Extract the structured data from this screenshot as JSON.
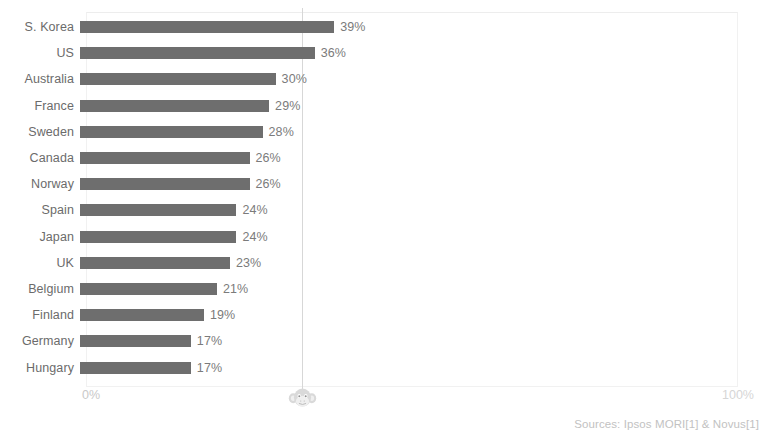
{
  "chart_data": {
    "type": "bar",
    "orientation": "horizontal",
    "title": "",
    "xlabel": "",
    "ylabel": "",
    "xlim": [
      0,
      100
    ],
    "grid": false,
    "legend": null,
    "axis_ticks": [
      "0%",
      "100%"
    ],
    "reference_line_value": 33,
    "categories": [
      "S. Korea",
      "US",
      "Australia",
      "France",
      "Sweden",
      "Canada",
      "Norway",
      "Spain",
      "Japan",
      "UK",
      "Belgium",
      "Finland",
      "Germany",
      "Hungary"
    ],
    "values": [
      39,
      36,
      30,
      29,
      28,
      26,
      26,
      24,
      24,
      23,
      21,
      19,
      17,
      17
    ],
    "value_labels": [
      "39%",
      "36%",
      "30%",
      "29%",
      "28%",
      "26%",
      "26%",
      "24%",
      "24%",
      "23%",
      "21%",
      "19%",
      "17%",
      "17%"
    ],
    "annotations": [
      "Sources: Ipsos MORI[1] & Novus[1]"
    ]
  },
  "axis": {
    "min_label": "0%",
    "max_label": "100%"
  },
  "footer": {
    "sources": "Sources: Ipsos MORI[1] & Novus[1]"
  },
  "marker": {
    "icon": "monkey-face-icon",
    "color": "#d9d9d9"
  },
  "colors": {
    "bar": "#6e6e6e",
    "label": "#6b6b6b",
    "value": "#7b7b7b",
    "axis": "#c9c9c9",
    "reference_line": "#d7d7d7",
    "panel_border": "#f1f1f1",
    "source": "#c2c2c2"
  }
}
